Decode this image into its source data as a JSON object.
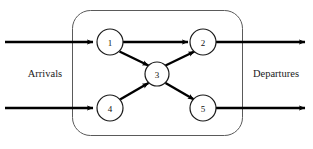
{
  "diagram": {
    "type": "flow-network",
    "title": "",
    "boundary": {
      "name": "system-boundary",
      "shape": "rounded-rectangle",
      "x": 72,
      "y": 10,
      "width": 171,
      "height": 126,
      "corner_radius": 18,
      "stroke_color": "#5a5a5a"
    },
    "labels": {
      "left": "Arrivals",
      "right": "Departures"
    },
    "nodes": [
      {
        "id": "1",
        "label": "1",
        "cx": 110,
        "cy": 42,
        "r": 13
      },
      {
        "id": "2",
        "label": "2",
        "cx": 203,
        "cy": 42,
        "r": 13
      },
      {
        "id": "3",
        "label": "3",
        "cx": 157,
        "cy": 74,
        "r": 12
      },
      {
        "id": "4",
        "label": "4",
        "cx": 110,
        "cy": 108,
        "r": 13
      },
      {
        "id": "5",
        "label": "5",
        "cx": 203,
        "cy": 108,
        "r": 13
      }
    ],
    "internal_edges": [
      {
        "from": "1",
        "to": "2",
        "arrow": true
      },
      {
        "from": "1",
        "to": "3",
        "arrow": true
      },
      {
        "from": "3",
        "to": "2",
        "arrow": true
      },
      {
        "from": "4",
        "to": "3",
        "arrow": true
      },
      {
        "from": "3",
        "to": "5",
        "arrow": true
      }
    ],
    "external_flows": [
      {
        "name": "arrival-flow-top",
        "direction": "in",
        "from_x": 5,
        "to_x": 95,
        "y": 42,
        "arrow": true
      },
      {
        "name": "arrival-flow-bottom",
        "direction": "in",
        "from_x": 5,
        "to_x": 95,
        "y": 108,
        "arrow": true
      },
      {
        "name": "departure-flow-top",
        "direction": "out",
        "from_x": 216,
        "to_x": 307,
        "y": 42,
        "arrow": true
      },
      {
        "name": "departure-flow-bottom",
        "direction": "out",
        "from_x": 216,
        "to_x": 307,
        "y": 108,
        "arrow": true
      }
    ],
    "colors": {
      "line": "#000000",
      "node_stroke": "#1a1a1a",
      "node_fill": "#ffffff",
      "boundary_stroke": "#5a5a5a",
      "text": "#1a1a1a",
      "background": "#ffffff"
    }
  }
}
